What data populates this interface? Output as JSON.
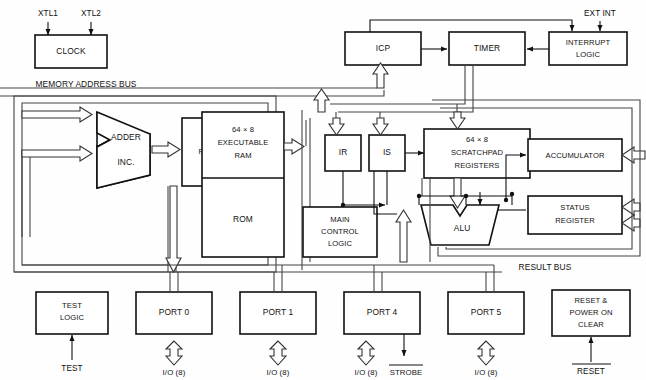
{
  "figure": {
    "type": "block-diagram",
    "background_color": "#fefefe",
    "line_color": "#111111",
    "bus_color": "#444444"
  },
  "bus_labels": {
    "memory_address_bus": "MEMORY ADDRESS BUS",
    "result_bus": "RESULT BUS"
  },
  "signals": {
    "xtl1": "XTL1",
    "xtl2": "XTL2",
    "ext_int": "EXT INT",
    "test": "TEST",
    "reset": "RESET",
    "strobe": "STROBE",
    "io8": "I/O (8)"
  },
  "blocks": {
    "clock": {
      "label": "CLOCK"
    },
    "adder": {
      "line1": "ADDER",
      "line2": "INC."
    },
    "memory_address_registers": {
      "line1": "MEMORY",
      "line2": "ADDRESS",
      "line3": "REGISTERS",
      "line4": "PO: P",
      "line5": "DC.DC1"
    },
    "ram": {
      "line1": "64  ×  8",
      "line2": "EXECUTABLE",
      "line3": "RAM"
    },
    "rom": {
      "label": "ROM"
    },
    "icp": {
      "label": "ICP"
    },
    "timer": {
      "label": "TIMER"
    },
    "interrupt_logic": {
      "line1": "INTERRUPT",
      "line2": "LOGIC"
    },
    "ir": {
      "label": "IR"
    },
    "is": {
      "label": "IS"
    },
    "scratchpad": {
      "line1": "64  ×  8",
      "line2": "SCRATCHPAD",
      "line3": "REGISTERS"
    },
    "accumulator": {
      "label": "ACCUMULATOR"
    },
    "status_register": {
      "line1": "STATUS",
      "line2": "REGISTER"
    },
    "main_control_logic": {
      "line1": "MAIN",
      "line2": "CONTROL",
      "line3": "LOGIC"
    },
    "alu": {
      "label": "ALU"
    },
    "test_logic": {
      "line1": "TEST",
      "line2": "LOGIC"
    },
    "port0": {
      "label": "PORT 0"
    },
    "port1": {
      "label": "PORT 1"
    },
    "port4": {
      "label": "PORT 4"
    },
    "port5": {
      "label": "PORT 5"
    },
    "reset_power_on_clear": {
      "line1": "RESET &",
      "line2": "POWER ON",
      "line3": "CLEAR"
    }
  },
  "io_ports": [
    {
      "name": "PORT 0",
      "io": "I/O (8)"
    },
    {
      "name": "PORT 1",
      "io": "I/O (8)"
    },
    {
      "name": "PORT 4",
      "io": "I/O (8)",
      "extra": "STROBE"
    },
    {
      "name": "PORT 5",
      "io": "I/O (8)"
    }
  ]
}
